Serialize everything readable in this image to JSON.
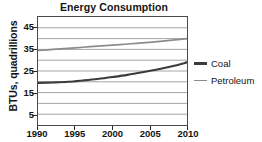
{
  "chart_data": {
    "type": "line",
    "title": "Energy Consumption",
    "xlabel": "",
    "ylabel": "BTUs, quadrillions",
    "xlim": [
      1990,
      2010
    ],
    "ylim": [
      0,
      50
    ],
    "grid": true,
    "grid_axis": "y",
    "legend_position": "right",
    "xticks": [
      1990,
      1995,
      2000,
      2005,
      2010
    ],
    "xtick_labels": [
      "1990",
      "1995",
      "2000",
      "2005",
      "2010"
    ],
    "yticks": [
      5,
      15,
      25,
      35,
      45
    ],
    "ytick_labels": [
      "5",
      "15",
      "25",
      "35",
      "45"
    ],
    "ygridlines": [
      5,
      10,
      15,
      20,
      25,
      30,
      35,
      40,
      45
    ],
    "x": [
      1990,
      1992,
      1994,
      1996,
      1998,
      2000,
      2002,
      2004,
      2006,
      2008,
      2010
    ],
    "series": [
      {
        "name": "Coal",
        "color": "#3c3c3c",
        "width": 2.1,
        "values": [
          19.5,
          19.7,
          20.0,
          20.6,
          21.3,
          22.2,
          23.2,
          24.4,
          25.7,
          27.2,
          29.0
        ]
      },
      {
        "name": "Petroleum",
        "color": "#8c8c8c",
        "width": 1.7,
        "values": [
          34.5,
          35.0,
          35.5,
          36.0,
          36.5,
          37.0,
          37.5,
          38.0,
          38.6,
          39.3,
          40.0
        ]
      }
    ]
  },
  "legend": {
    "items": [
      {
        "label": "Coal",
        "color": "#3c3c3c",
        "thickness": "2.4px"
      },
      {
        "label": "Petroleum",
        "color": "#8c8c8c",
        "thickness": "1.8px"
      }
    ]
  },
  "colors": {
    "axis": "#4a4a4a",
    "grid": "#9a9a9a",
    "text": "#141414",
    "background": "#ffffff"
  }
}
